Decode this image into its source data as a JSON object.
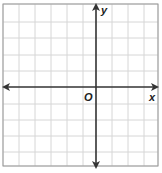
{
  "diagram": {
    "type": "coordinate-plane",
    "frame": {
      "x": 3,
      "y": 4,
      "width": 155,
      "height": 162
    },
    "grid": {
      "vertical_lines_x": [
        3,
        19,
        35,
        51,
        67,
        83,
        112,
        128,
        144,
        158
      ],
      "horizontal_lines_y": [
        4,
        22,
        38,
        55,
        71,
        104,
        120,
        136,
        152,
        166
      ],
      "line_color": "#d6d6d6",
      "frame_color": "#999999"
    },
    "axes": {
      "x_axis": {
        "y": 87,
        "x_start": 4,
        "x_end": 157,
        "label": "x",
        "arrows": "both"
      },
      "y_axis": {
        "x": 96,
        "y_start": 5,
        "y_end": 167,
        "label": "y",
        "arrows": "both"
      },
      "origin_label": "O",
      "axis_color": "#333333"
    },
    "labels": {
      "x": "x",
      "y": "y",
      "origin": "O"
    }
  }
}
